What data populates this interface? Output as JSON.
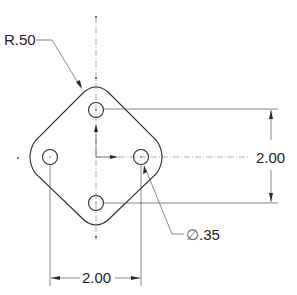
{
  "drawing": {
    "title": "Diamond plate with four holes",
    "units": "in",
    "part": {
      "shape": "rounded square rotated 45 degrees",
      "corner_radius": 0.5,
      "hole_count": 4,
      "hole_diameter": 0.35,
      "hole_pattern": "four holes on diamond vertices"
    },
    "dimensions": {
      "radius_label": "R.50",
      "vertical_label": "2.00",
      "horizontal_label": "2.00",
      "diameter_symbol": "∅",
      "diameter_value": ".35"
    },
    "colors": {
      "line": "#2b2b2b",
      "centerline": "#777777",
      "background": "#ffffff"
    }
  }
}
